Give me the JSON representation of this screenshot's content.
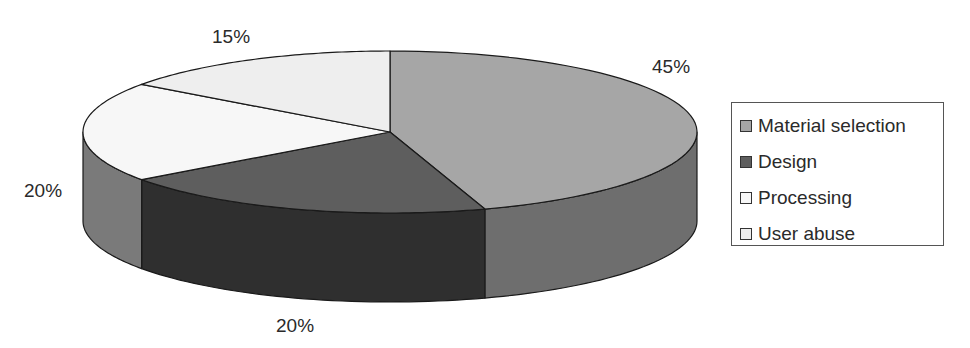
{
  "chart_data": {
    "type": "pie",
    "style": "3d-exploded-none",
    "title": "",
    "categories": [
      "Material selection",
      "Design",
      "Processing",
      "User abuse"
    ],
    "values": [
      45,
      20,
      20,
      15
    ],
    "unit": "%",
    "data_labels": [
      "45%",
      "20%",
      "20%",
      "15%"
    ],
    "colors": {
      "Material selection": {
        "top": "#a6a6a6",
        "side": "#6e6e6e"
      },
      "Design": {
        "top": "#5e5e5e",
        "side": "#2f2f2f"
      },
      "Processing": {
        "top": "#f7f7f7",
        "side": "#7a7a7a"
      },
      "User abuse": {
        "top": "#eeeeee",
        "side": "#bdbdbd"
      }
    },
    "legend_position": "right",
    "start_angle": "12 o'clock, clockwise"
  },
  "labels": {
    "material": "45%",
    "design": "20%",
    "processing": "20%",
    "user_abuse": "15%"
  },
  "legend": {
    "items": [
      {
        "label": "Material selection",
        "color": "#a6a6a6"
      },
      {
        "label": "Design",
        "color": "#5e5e5e"
      },
      {
        "label": "Processing",
        "color": "#f7f7f7"
      },
      {
        "label": "User abuse",
        "color": "#eeeeee"
      }
    ]
  }
}
